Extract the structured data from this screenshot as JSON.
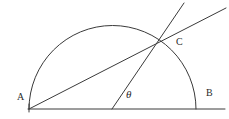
{
  "figure": {
    "kind": "geometry-diagram",
    "canvas": {
      "width": 229,
      "height": 119,
      "background": "#ffffff"
    },
    "stroke_color": "#3a3a3a",
    "text_color": "#2b2b2b",
    "labels": {
      "A": "A",
      "B": "B",
      "C": "C",
      "theta": "θ"
    },
    "points": {
      "A": {
        "x": 29,
        "y": 109
      },
      "B": {
        "x": 196,
        "y": 109
      },
      "C": {
        "x": 165,
        "y": 37
      },
      "center": {
        "x": 112.5,
        "y": 109
      }
    },
    "semicircle": {
      "center_x": 112.5,
      "center_y": 109,
      "radius": 83.5,
      "start_angle_deg": 180,
      "end_angle_deg": 0
    },
    "segments": [
      {
        "name": "baseline",
        "x1": 28,
        "y1": 109,
        "x2": 225,
        "y2": 109
      },
      {
        "name": "chord-A-through-C-extended",
        "x1": 29,
        "y1": 109,
        "x2": 226,
        "y2": 8
      },
      {
        "name": "radius-center-through-C-extended",
        "x1": 112,
        "y1": 109,
        "x2": 184,
        "y2": 3
      }
    ]
  }
}
